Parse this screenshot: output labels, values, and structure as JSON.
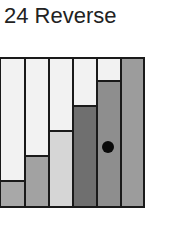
{
  "header": {
    "title": "24 Reverse"
  },
  "board": {
    "columns": [
      {
        "index": 1,
        "fill_height": 24,
        "fill_color": "#a8a8a8",
        "empty_color": "#f3f3f3"
      },
      {
        "index": 2,
        "fill_height": 49,
        "fill_color": "#a2a2a2",
        "empty_color": "#f3f3f3"
      },
      {
        "index": 3,
        "fill_height": 74,
        "fill_color": "#d6d6d6",
        "empty_color": "#f3f3f3"
      },
      {
        "index": 4,
        "fill_height": 99,
        "fill_color": "#6f6f6f",
        "empty_color": "#f3f3f3"
      },
      {
        "index": 5,
        "fill_height": 124,
        "fill_color": "#8e8e8e",
        "empty_color": "#f3f3f3"
      },
      {
        "index": 6,
        "fill_height": 149,
        "fill_color": "#9c9c9c",
        "empty_color": "#f3f3f3"
      }
    ],
    "marker": {
      "column": 5,
      "icon": "black-dot-icon",
      "color": "#0a0a0a"
    }
  }
}
